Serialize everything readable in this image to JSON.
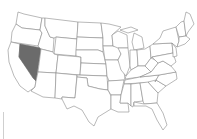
{
  "map": {
    "title": "United States",
    "highlighted_state": "Nevada",
    "colors": {
      "background": "#ffffff",
      "state_fill": "#ffffff",
      "state_border": "#8a8a8a",
      "highlight_fill": "#6b6b6b"
    }
  }
}
